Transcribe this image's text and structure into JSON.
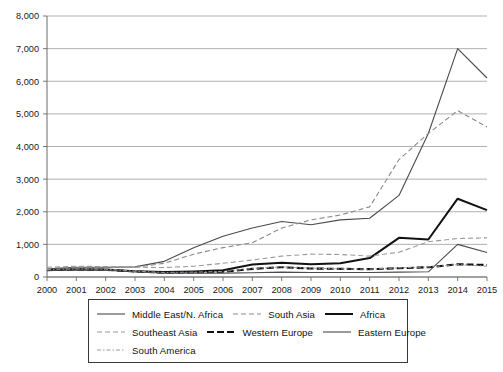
{
  "chart_data": {
    "type": "line",
    "title": "",
    "subtitle": "",
    "xlabel": "",
    "ylabel": "",
    "grid": true,
    "legend_position": "bottom",
    "xlim": [
      2000,
      2015
    ],
    "ylim": [
      0,
      8000
    ],
    "ytick_step": 1000,
    "categories": [
      "2000",
      "2001",
      "2002",
      "2003",
      "2004",
      "2005",
      "2006",
      "2007",
      "2008",
      "2009",
      "2010",
      "2011",
      "2012",
      "2013",
      "2014",
      "2015"
    ],
    "ytick_labels": [
      "0",
      "1,000",
      "2,000",
      "3,000",
      "4,000",
      "5,000",
      "6,000",
      "7,000",
      "8,000"
    ],
    "series": [
      {
        "name": "Middle East/N. Africa",
        "style": "solid",
        "color": "#4a4a4a",
        "width": 1.1,
        "dash": "",
        "values": [
          250,
          300,
          300,
          310,
          480,
          900,
          1250,
          1500,
          1700,
          1600,
          1750,
          1800,
          2500,
          4400,
          7000,
          6100
        ]
      },
      {
        "name": "South Asia",
        "style": "dashed",
        "color": "#8a8a8a",
        "width": 1.1,
        "dash": "5,3",
        "values": [
          260,
          300,
          300,
          300,
          420,
          700,
          900,
          1050,
          1500,
          1750,
          1900,
          2150,
          3600,
          4400,
          5100,
          4600
        ]
      },
      {
        "name": "Africa",
        "style": "solid-thick",
        "color": "#111111",
        "width": 2.0,
        "dash": "",
        "values": [
          215,
          240,
          230,
          180,
          150,
          170,
          210,
          380,
          440,
          390,
          420,
          580,
          1200,
          1150,
          2400,
          2050
        ]
      },
      {
        "name": "Southeast Asia",
        "style": "dashed",
        "color": "#9a9a9a",
        "width": 1.1,
        "dash": "5,3",
        "values": [
          300,
          330,
          320,
          300,
          290,
          330,
          420,
          520,
          640,
          700,
          690,
          640,
          760,
          1080,
          1180,
          1200
        ]
      },
      {
        "name": "Western Europe",
        "style": "dashed-thick",
        "color": "#111111",
        "width": 2.1,
        "dash": "7,3",
        "values": [
          210,
          230,
          220,
          170,
          130,
          140,
          160,
          250,
          300,
          260,
          250,
          240,
          270,
          300,
          390,
          370
        ]
      },
      {
        "name": "Eastern Europe",
        "style": "solid",
        "color": "#4a4a4a",
        "width": 1.1,
        "dash": "",
        "values": [
          200,
          220,
          210,
          160,
          120,
          120,
          120,
          130,
          150,
          140,
          140,
          140,
          150,
          160,
          1000,
          750
        ]
      },
      {
        "name": "South America",
        "style": "dash-dot",
        "color": "#9a9a9a",
        "width": 1.0,
        "dash": "4,2,1.5,2",
        "values": [
          230,
          250,
          240,
          180,
          140,
          150,
          170,
          260,
          310,
          270,
          250,
          240,
          280,
          310,
          380,
          330
        ]
      }
    ]
  },
  "legend": {
    "rows": [
      [
        {
          "label": "Middle East/N. Africa",
          "series_index": 0
        },
        {
          "label": "South Asia",
          "series_index": 1
        },
        {
          "label": "Africa",
          "series_index": 2
        }
      ],
      [
        {
          "label": "Southeast Asia",
          "series_index": 3
        },
        {
          "label": "Western Europe",
          "series_index": 4
        },
        {
          "label": "Eastern Europe",
          "series_index": 5
        }
      ],
      [
        {
          "label": "South America",
          "series_index": 6
        }
      ]
    ]
  }
}
